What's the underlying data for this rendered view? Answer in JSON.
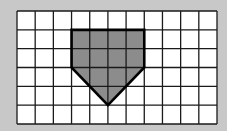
{
  "diagram": {
    "type": "grid-shape",
    "grid": {
      "columns": 11,
      "rows": 6,
      "line_color": "#1a1a1a",
      "cell_fill": "#ffffff"
    },
    "shape": {
      "name": "pentagon",
      "fill": "#8c8c8c",
      "stroke": "#000000",
      "vertices_grid_units": [
        [
          3,
          1
        ],
        [
          7,
          1
        ],
        [
          7,
          3
        ],
        [
          5,
          5
        ],
        [
          3,
          3
        ]
      ]
    },
    "background": "#c8c8c8"
  }
}
